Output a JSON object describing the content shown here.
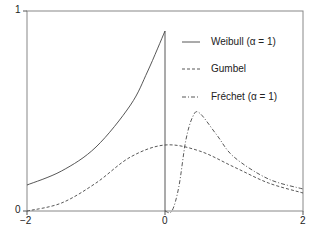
{
  "chart_data": {
    "type": "line",
    "title": "",
    "xlabel": "",
    "ylabel": "",
    "xlim": [
      -2,
      2
    ],
    "ylim": [
      0,
      1
    ],
    "x_ticks": [
      "-2",
      "0",
      "2"
    ],
    "y_ticks": [
      "0",
      "1"
    ],
    "grid": false,
    "legend_position": "upper right (inside)",
    "series": [
      {
        "name": "Weibull (α = 1)",
        "style": "solid",
        "x": [
          -2,
          -1.5,
          -1,
          -0.5,
          -0.25,
          0,
          0
        ],
        "values": [
          0.13,
          0.2,
          0.32,
          0.53,
          0.7,
          0.9,
          0.0
        ]
      },
      {
        "name": "Gumbel",
        "style": "dashed",
        "x": [
          -2,
          -1.5,
          -1,
          -0.5,
          0,
          0.5,
          1,
          1.5,
          2
        ],
        "values": [
          0.0,
          0.04,
          0.14,
          0.27,
          0.33,
          0.3,
          0.22,
          0.14,
          0.09
        ]
      },
      {
        "name": "Fréchet (α = 1)",
        "style": "dash-dot",
        "x": [
          0,
          0.1,
          0.2,
          0.3,
          0.4,
          0.5,
          0.75,
          1,
          1.5,
          2
        ],
        "values": [
          0.0,
          0.0,
          0.12,
          0.35,
          0.47,
          0.49,
          0.38,
          0.27,
          0.16,
          0.11
        ]
      }
    ]
  },
  "axes": {
    "x_tick_labels": [
      "−2",
      "0",
      "2"
    ],
    "y_tick_labels": [
      "0",
      "1"
    ]
  },
  "legend": {
    "items": [
      {
        "label": "Weibull (α = 1)"
      },
      {
        "label": "Gumbel"
      },
      {
        "label": "Fréchet (α = 1)"
      }
    ]
  }
}
